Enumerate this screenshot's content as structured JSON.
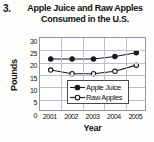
{
  "problem": {
    "number": "3."
  },
  "chart_data": {
    "type": "line",
    "title": "Apple Juice and Raw Apples Consumed in the U.S.",
    "title_line1": "Apple Juice and Raw Apples",
    "title_line2": "Consumed in the U.S.",
    "xlabel": "Year",
    "ylabel": "Pounds",
    "categories": [
      "2001",
      "2002",
      "2003",
      "2004",
      "2005"
    ],
    "x": [
      2001,
      2002,
      2003,
      2004,
      2005
    ],
    "series": [
      {
        "name": "Apple Juice",
        "marker": "filled-circle",
        "color": "#1a1a1a",
        "values": [
          21.5,
          21.5,
          21.5,
          22.5,
          24
        ]
      },
      {
        "name": "Raw Apples",
        "marker": "open-circle",
        "color": "#1a1a1a",
        "values": [
          17,
          15.5,
          15.5,
          16.5,
          19
        ]
      }
    ],
    "ylim": [
      0,
      30
    ],
    "yticks": [
      0,
      5,
      10,
      15,
      20,
      25,
      30
    ],
    "ytick_labels": [
      "0",
      "5",
      "10",
      "15",
      "20",
      "25",
      "30"
    ],
    "grid": true,
    "legend_position": "inside-bottom-right",
    "grid_color": "#b9c0ce",
    "frame_color": "#8c95a8",
    "background": "#ffffff"
  }
}
